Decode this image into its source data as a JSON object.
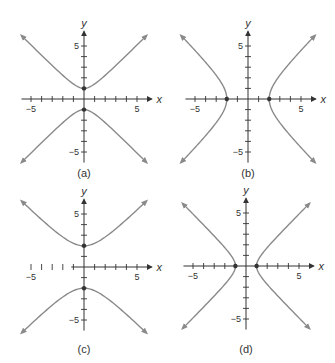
{
  "colors": {
    "curve": "#8a8a8a",
    "axis": "#333333",
    "background": "#ffffff"
  },
  "chart_data": [
    {
      "type": "line",
      "label": "(a)",
      "equation": "y^2 - x^2 = 1",
      "orientation": "vertical",
      "a": 1,
      "b": 1,
      "vertices": [
        [
          0,
          1
        ],
        [
          0,
          -1
        ]
      ],
      "xlabel": "x",
      "ylabel": "y",
      "xlim": [
        -5.9,
        6
      ],
      "ylim": [
        -6,
        6
      ],
      "xticks": [
        -5,
        5
      ],
      "yticks": [
        5,
        -5
      ],
      "tick_step": 1,
      "grid": false
    },
    {
      "type": "line",
      "label": "(b)",
      "equation": "x^2/4 - y^2/4 = 1",
      "orientation": "horizontal",
      "a": 2,
      "b": 2,
      "vertices": [
        [
          -2,
          0
        ],
        [
          2,
          0
        ]
      ],
      "xlabel": "x",
      "ylabel": "y",
      "xlim": [
        -5.9,
        6
      ],
      "ylim": [
        -6,
        6
      ],
      "xticks": [
        -5,
        5
      ],
      "yticks": [
        5,
        -5
      ],
      "tick_step": 1,
      "grid": false
    },
    {
      "type": "line",
      "label": "(c)",
      "equation": "y^2/4 - x^2/4 = 1",
      "orientation": "vertical",
      "a": 2,
      "b": 2,
      "vertices": [
        [
          0,
          2
        ],
        [
          0,
          -2
        ]
      ],
      "xlabel": "x",
      "ylabel": "y",
      "xlim": [
        -5.9,
        6
      ],
      "ylim": [
        -6,
        6
      ],
      "xticks": [
        -5,
        5
      ],
      "yticks": [
        5,
        -5
      ],
      "tick_step": 1,
      "grid": false
    },
    {
      "type": "line",
      "label": "(d)",
      "equation": "x^2 - y^2 = 1",
      "orientation": "horizontal",
      "a": 1,
      "b": 1,
      "vertices": [
        [
          -1,
          0
        ],
        [
          1,
          0
        ]
      ],
      "xlabel": "x",
      "ylabel": "y",
      "xlim": [
        -5.9,
        6
      ],
      "ylim": [
        -6,
        6
      ],
      "xticks": [
        -5,
        5
      ],
      "yticks": [
        5,
        -5
      ],
      "tick_step": 1,
      "grid": false
    }
  ],
  "panels": [
    {
      "label": "(a)",
      "xlabel": "x",
      "ylabel": "y",
      "tick_neg": "−5",
      "tick_pos": "5"
    },
    {
      "label": "(b)",
      "xlabel": "x",
      "ylabel": "y",
      "tick_neg": "−5",
      "tick_pos": "5"
    },
    {
      "label": "(c)",
      "xlabel": "x",
      "ylabel": "y",
      "tick_neg": "−5",
      "tick_pos": "5"
    },
    {
      "label": "(d)",
      "xlabel": "x",
      "ylabel": "y",
      "tick_neg": "−5",
      "tick_pos": "5"
    }
  ]
}
